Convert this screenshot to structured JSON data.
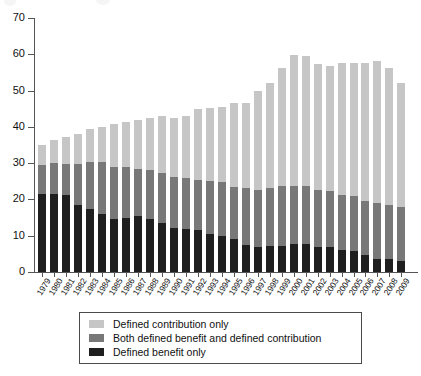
{
  "chart_data": {
    "type": "bar",
    "subtype": "stacked-vertical",
    "title": "",
    "subtitle": "",
    "xlabel": "",
    "ylabel": "",
    "ylim": [
      0,
      70
    ],
    "yticks": [
      0,
      10,
      20,
      30,
      40,
      50,
      60,
      70
    ],
    "grid": false,
    "legend_position": "bottom-center",
    "categories": [
      "1979",
      "1980",
      "1981",
      "1982",
      "1983",
      "1984",
      "1985",
      "1986",
      "1987",
      "1988",
      "1989",
      "1990",
      "1991",
      "1992",
      "1993",
      "1994",
      "1995",
      "1996",
      "1997",
      "1998",
      "1999",
      "2000",
      "2001",
      "2002",
      "2003",
      "2004",
      "2005",
      "2006",
      "2007",
      "2008",
      "2009"
    ],
    "series": [
      {
        "name": "Defined benefit only",
        "color": "#1f1f1f",
        "values": [
          21.4,
          21.5,
          21.3,
          18.5,
          17.3,
          16.1,
          14.5,
          15.0,
          15.4,
          14.7,
          13.5,
          12.2,
          11.9,
          11.7,
          10.4,
          9.9,
          9.0,
          7.5,
          6.8,
          7.3,
          7.3,
          7.7,
          7.7,
          6.8,
          6.8,
          6.0,
          5.9,
          4.6,
          3.5,
          3.5,
          3.1
        ]
      },
      {
        "name": "Both defined benefit and defined contribution",
        "color": "#787878",
        "values": [
          8.0,
          8.6,
          8.6,
          11.3,
          13.0,
          14.2,
          14.4,
          13.9,
          13.0,
          13.4,
          13.8,
          14.0,
          13.9,
          13.7,
          14.8,
          14.8,
          14.5,
          15.6,
          15.9,
          15.9,
          16.3,
          16.0,
          16.0,
          15.7,
          15.4,
          15.3,
          15.0,
          14.9,
          15.4,
          14.9,
          14.7
        ]
      },
      {
        "name": "Defined contribution only",
        "color": "#c6c6c6",
        "values": [
          5.7,
          6.2,
          7.4,
          8.3,
          9.1,
          9.8,
          11.9,
          12.5,
          13.4,
          14.3,
          15.6,
          16.2,
          17.2,
          19.6,
          19.9,
          20.9,
          23.0,
          23.4,
          27.3,
          29.0,
          32.7,
          36.0,
          35.8,
          34.7,
          34.7,
          36.4,
          36.6,
          38.0,
          39.2,
          37.9,
          34.4
        ]
      }
    ],
    "totals": [
      35.1,
      36.3,
      37.3,
      38.1,
      39.4,
      40.1,
      40.8,
      41.4,
      41.8,
      42.4,
      42.9,
      42.4,
      43.0,
      45.0,
      45.1,
      45.6,
      46.5,
      46.5,
      50.0,
      52.2,
      56.3,
      59.7,
      59.5,
      57.2,
      56.9,
      57.7,
      57.5,
      57.5,
      58.1,
      56.3,
      52.2
    ]
  },
  "legend": {
    "items": [
      {
        "label": "Defined contribution only",
        "color": "#c6c6c6"
      },
      {
        "label": "Both defined benefit and defined contribution",
        "color": "#787878"
      },
      {
        "label": "Defined benefit only",
        "color": "#1f1f1f"
      }
    ]
  },
  "axis": {
    "y_tick_labels": [
      "0",
      "10",
      "20",
      "30",
      "40",
      "50",
      "60",
      "70"
    ]
  }
}
